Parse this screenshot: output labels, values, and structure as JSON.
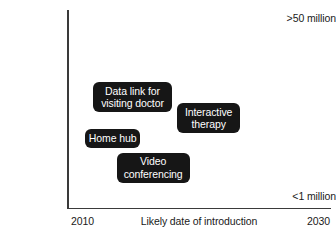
{
  "chart_data": {
    "type": "scatter",
    "title": "",
    "xlabel": "Likely date of introduction",
    "ylabel": "Approximate market size in UK",
    "xlim": [
      "2010",
      "2030"
    ],
    "ylim": [
      "<1 million",
      ">50 million"
    ],
    "x_ticks": [
      "2010",
      "2030"
    ],
    "y_ticks": [
      "<1 million",
      ">50 million"
    ],
    "grid": false,
    "legend": "none",
    "points": [
      {
        "label": "Data link for visiting doctor",
        "lines": [
          "Data link for",
          "visiting doctor"
        ],
        "x_pct": 9.5,
        "y_pct": 36.5,
        "width": 79,
        "height": 30
      },
      {
        "label": "Interactive therapy",
        "lines": [
          "Interactive",
          "therapy"
        ],
        "x_pct": 41.5,
        "y_pct": 47.0,
        "width": 63,
        "height": 30
      },
      {
        "label": "Home hub",
        "lines": [
          "Home hub"
        ],
        "x_pct": 6.5,
        "y_pct": 60.0,
        "width": 55,
        "height": 19
      },
      {
        "label": "Video conferencing",
        "lines": [
          "Video",
          "conferencing"
        ],
        "x_pct": 18.5,
        "y_pct": 72.0,
        "width": 73,
        "height": 30
      }
    ]
  },
  "axes": {
    "y_title": "Approximate market size in UK",
    "y_tick_top": ">50 million",
    "y_tick_bottom": "<1 million",
    "x_title": "Likely date of introduction",
    "x_tick_left": "2010",
    "x_tick_right": "2030"
  },
  "colors": {
    "background": "#ffffff",
    "axis": "#3a3a3a",
    "box_fill": "#161616",
    "box_text": "#ffffff",
    "text": "#1a1a1a"
  }
}
